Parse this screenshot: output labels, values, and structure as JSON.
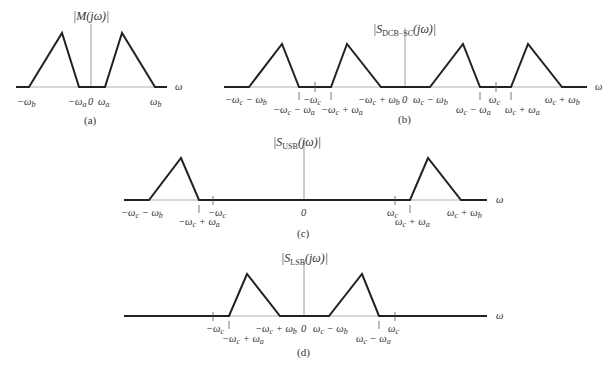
{
  "figure": {
    "panels": [
      {
        "id": "a",
        "caption": "(a)",
        "title": "|M(jω)|",
        "axis_var": "ω",
        "tick_labels": [
          "−ω_b",
          "−ω_a",
          "0",
          "ω_a",
          "ω_b"
        ]
      },
      {
        "id": "b",
        "caption": "(b)",
        "title": "|S_DCB−SC(jω)|",
        "title_main": "|S",
        "title_sub": "DCB−SC",
        "title_tail": "(jω)|",
        "axis_var": "ω",
        "tick_labels": [
          "−ω_c − ω_b",
          "−ω_c − ω_a",
          "−ω_c",
          "−ω_c + ω_a",
          "−ω_c + ω_b",
          "0",
          "ω_c − ω_b",
          "ω_c − ω_a",
          "ω_c",
          "ω_c + ω_a",
          "ω_c + ω_b"
        ]
      },
      {
        "id": "c",
        "caption": "(c)",
        "title": "|S_USB(jω)|",
        "title_main": "|S",
        "title_sub": "USB",
        "title_tail": "(jω)|",
        "axis_var": "ω",
        "tick_labels": [
          "−ω_c − ω_b",
          "−ω_c + ω_a",
          "−ω_c",
          "0",
          "ω_c",
          "ω_c + ω_a",
          "ω_c + ω_b"
        ]
      },
      {
        "id": "d",
        "caption": "(d)",
        "title": "|S_LSB(jω)|",
        "title_main": "|S",
        "title_sub": "LSB",
        "title_tail": "(jω)|",
        "axis_var": "ω",
        "tick_labels": [
          "−ω_c",
          "−ω_c + ω_a",
          "−ω_c + ω_b",
          "0",
          "ω_c − ω_b",
          "ω_c − ω_a",
          "ω_c"
        ]
      }
    ]
  }
}
